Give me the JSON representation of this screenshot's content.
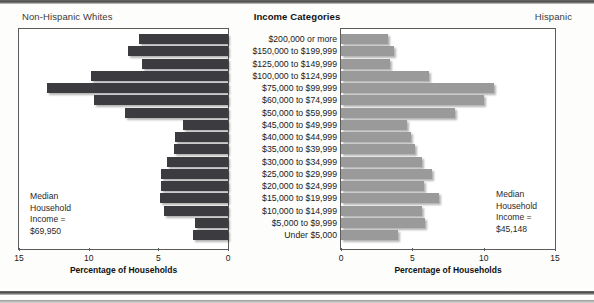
{
  "header": {
    "left_label": "Non-Hispanic Whites",
    "center_label": "Income Categories",
    "right_label": "Hispanic"
  },
  "axis": {
    "title_left": "Percentage of Households",
    "title_right": "Percentage of Households",
    "ticks_left": [
      "15",
      "10",
      "5",
      "0"
    ],
    "ticks_right": [
      "0",
      "5",
      "10",
      "15"
    ]
  },
  "median_left": {
    "line1": "Median",
    "line2": "Household",
    "line3": "Income =",
    "line4": "$69,950"
  },
  "median_right": {
    "line1": "Median",
    "line2": "Household",
    "line3": "Income =",
    "line4": "$45,148"
  },
  "colors": {
    "left_bar": "#3b3b40",
    "right_bar": "#9a9a9a",
    "panel_border": "#5b5b5b",
    "page_background": "#fdfdfb"
  },
  "chart_data": {
    "type": "bar",
    "title": "Income Categories",
    "orientation": "horizontal-pyramid",
    "xlabel": "Percentage of Households",
    "ylabel": "Income Categories",
    "xlim": [
      0,
      15
    ],
    "grid": false,
    "legend": "none",
    "categories": [
      "$200,000 or more",
      "$150,000 to $199,999",
      "$125,000 to $149,999",
      "$100,000 to $124,999",
      "$75,000 to $99,999",
      "$60,000 to $74,999",
      "$50,000 to $59,999",
      "$45,000 to $49,999",
      "$40,000 to $44,999",
      "$35,000 to $39,999",
      "$30,000 to $34,999",
      "$25,000 to $29,999",
      "$20,000 to $24,999",
      "$15,000 to $19,999",
      "$10,000 to $14,999",
      "$5,000 to $9,999",
      "Under $5,000"
    ],
    "series": [
      {
        "name": "Non-Hispanic Whites",
        "direction": "left",
        "color": "#3b3b40",
        "median_household_income": "$69,950",
        "values": [
          6.4,
          7.2,
          6.2,
          9.8,
          13.0,
          9.6,
          7.4,
          3.2,
          3.8,
          3.9,
          4.4,
          4.8,
          4.8,
          4.9,
          4.6,
          2.4,
          2.5
        ]
      },
      {
        "name": "Hispanic",
        "direction": "right",
        "color": "#9a9a9a",
        "median_household_income": "$45,148",
        "values": [
          3.3,
          3.7,
          3.4,
          6.2,
          10.7,
          10.0,
          8.0,
          4.6,
          4.9,
          5.2,
          5.7,
          6.4,
          5.8,
          6.9,
          5.7,
          5.9,
          4.0
        ]
      }
    ]
  }
}
